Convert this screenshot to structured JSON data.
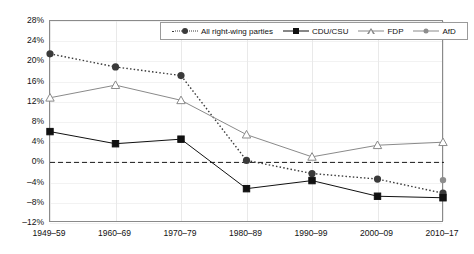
{
  "chart_data": {
    "type": "line",
    "title": "",
    "xlabel": "",
    "ylabel": "",
    "categories": [
      "1949–59",
      "1960–69",
      "1970–79",
      "1980–89",
      "1990–99",
      "2000–09",
      "2010–17"
    ],
    "ylim": [
      -12,
      28
    ],
    "yticks": [
      "28%",
      "24%",
      "20%",
      "16%",
      "12%",
      "8%",
      "4%",
      "0%",
      "–4%",
      "–8%",
      "–12%"
    ],
    "ytick_values": [
      28,
      24,
      20,
      16,
      12,
      8,
      4,
      0,
      -4,
      -8,
      -12
    ],
    "grid": true,
    "legend_position": "top-center",
    "zero_line": 0,
    "series": [
      {
        "name": "All right-wing parties",
        "marker": "circle-dark",
        "line": "dotted",
        "color": "#3a3a3a",
        "values": [
          21.5,
          18.9,
          17.2,
          0.4,
          -2.2,
          -3.3,
          -6.1
        ]
      },
      {
        "name": "CDU/CSU",
        "marker": "square-black",
        "line": "solid",
        "color": "#111111",
        "values": [
          6.1,
          3.7,
          4.6,
          -5.2,
          -3.6,
          -6.7,
          -7.0
        ]
      },
      {
        "name": "FDP",
        "marker": "triangle-open",
        "line": "solid",
        "color": "#8a8a8a",
        "values": [
          12.8,
          15.3,
          12.3,
          5.5,
          1.1,
          3.4,
          4.0
        ]
      },
      {
        "name": "AfD",
        "marker": "circle-gray",
        "line": "solid",
        "color": "#8d8d8d",
        "values": [
          null,
          null,
          null,
          null,
          null,
          null,
          -3.5
        ]
      }
    ]
  },
  "legend": {
    "items": [
      {
        "label": "All right-wing parties"
      },
      {
        "label": "CDU/CSU"
      },
      {
        "label": "FDP"
      },
      {
        "label": "AfD"
      }
    ]
  }
}
